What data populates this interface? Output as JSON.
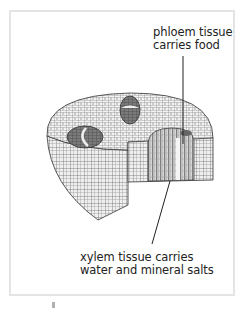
{
  "figure": {
    "type": "plant stem cross-section diagram",
    "labels": {
      "phloem": [
        "phloem tissue",
        "carries food"
      ],
      "xylem": [
        "xylem tissue carries",
        "water and mineral salts"
      ]
    }
  },
  "colors": {
    "line": "#333333",
    "cell_fill": "#f2f2f2",
    "bundle_fill": "#6a6a6a",
    "frame": "#e4e4e4"
  }
}
